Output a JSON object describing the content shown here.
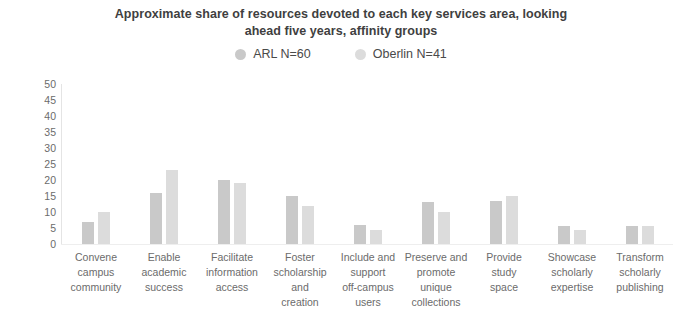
{
  "chart_data": {
    "type": "bar",
    "title": "Approximate share of resources devoted to each key services area, looking ahead five years, affinity groups",
    "title_lines": [
      "Approximate share of resources devoted to each key services area, looking",
      "ahead five years, affinity groups"
    ],
    "xlabel": "",
    "ylabel": "",
    "ylim": [
      0,
      50
    ],
    "yticks": [
      50,
      45,
      40,
      35,
      30,
      25,
      20,
      15,
      10,
      5,
      0
    ],
    "grid": false,
    "legend_position": "top-center",
    "categories": [
      "Convene campus community",
      "Enable academic success",
      "Facilitate information access",
      "Foster scholarship and creation",
      "Include and support off-campus users",
      "Preserve and promote unique collections",
      "Provide study space",
      "Showcase scholarly expertise",
      "Transform scholarly publishing"
    ],
    "category_lines": [
      [
        "Convene",
        "campus",
        "community"
      ],
      [
        "Enable",
        "academic",
        "success"
      ],
      [
        "Facilitate",
        "information",
        "access"
      ],
      [
        "Foster",
        "scholarship",
        "and",
        "creation"
      ],
      [
        "Include and",
        "support",
        "off-campus",
        "users"
      ],
      [
        "Preserve and",
        "promote",
        "unique",
        "collections"
      ],
      [
        "Provide",
        "study",
        "space"
      ],
      [
        "Showcase",
        "scholarly",
        "expertise"
      ],
      [
        "Transform",
        "scholarly",
        "publishing"
      ]
    ],
    "series": [
      {
        "name": "ARL N=60",
        "color": "#c9c9c9",
        "values": [
          7,
          16,
          20,
          15,
          6,
          13,
          13.5,
          5.5,
          5.5
        ]
      },
      {
        "name": "Oberlin N=41",
        "color": "#dcdcdc",
        "values": [
          10,
          23,
          19,
          12,
          4.5,
          10,
          15,
          4.5,
          5.5
        ]
      }
    ]
  },
  "legend": {
    "items": [
      {
        "label": "ARL N=60",
        "color": "#c9c9c9"
      },
      {
        "label": "Oberlin N=41",
        "color": "#dcdcdc"
      }
    ]
  },
  "colors": {
    "background": "#ffffff",
    "title_text": "#3f3f3f",
    "axis_text": "#6b6b6b",
    "series_arl": "#c9c9c9",
    "series_oberlin": "#dcdcdc"
  }
}
